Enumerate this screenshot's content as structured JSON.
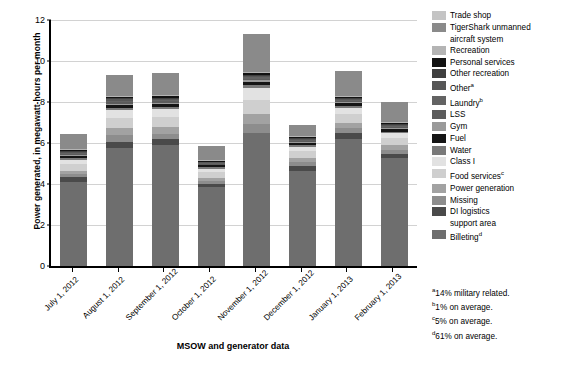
{
  "chart_data": {
    "type": "bar",
    "title": "",
    "xlabel": "MSOW and generator data",
    "ylabel": "Power generated, in megawatt-hours per month",
    "ylim": [
      0,
      12
    ],
    "yticks": [
      0,
      2,
      4,
      6,
      8,
      10,
      12
    ],
    "grid": true,
    "stacked": true,
    "legend_position": "right",
    "categories": [
      "July 1, 2012",
      "August 1, 2012",
      "September 1, 2012",
      "October 1, 2012",
      "November 1, 2012",
      "December 1, 2012",
      "January 1, 2013",
      "February 1, 2013"
    ],
    "totals": [
      6.45,
      9.28,
      9.33,
      5.88,
      11.32,
      7.35,
      9.25,
      7.95
    ],
    "series": [
      {
        "name": "Billeting",
        "color": "#6e6e6e",
        "values": [
          4.1,
          5.75,
          5.9,
          3.85,
          6.5,
          4.65,
          6.2,
          5.25
        ]
      },
      {
        "name": "DI logistics support area",
        "color": "#4a4a4a",
        "values": [
          0.22,
          0.32,
          0.28,
          0.16,
          0.0,
          0.25,
          0.3,
          0.22
        ]
      },
      {
        "name": "Missing",
        "color": "#8d8d8d",
        "values": [
          0.16,
          0.3,
          0.28,
          0.14,
          0.42,
          0.18,
          0.24,
          0.2
        ]
      },
      {
        "name": "Power generation",
        "color": "#a2a2a2",
        "values": [
          0.18,
          0.34,
          0.32,
          0.16,
          0.48,
          0.2,
          0.26,
          0.22
        ]
      },
      {
        "name": "Food services",
        "color": "#cfcfcf",
        "values": [
          0.3,
          0.52,
          0.5,
          0.26,
          0.72,
          0.32,
          0.42,
          0.34
        ]
      },
      {
        "name": "Class I",
        "color": "#e2e2e2",
        "values": [
          0.22,
          0.38,
          0.36,
          0.18,
          0.56,
          0.22,
          0.3,
          0.24
        ]
      },
      {
        "name": "Water",
        "color": "#7a7a7a",
        "values": [
          0.08,
          0.12,
          0.12,
          0.06,
          0.16,
          0.08,
          0.1,
          0.08
        ]
      },
      {
        "name": "Fuel",
        "color": "#151515",
        "values": [
          0.1,
          0.13,
          0.13,
          0.1,
          0.14,
          0.1,
          0.12,
          0.12
        ]
      },
      {
        "name": "Gym",
        "color": "#9a9a9a",
        "values": [
          0.05,
          0.07,
          0.07,
          0.04,
          0.08,
          0.05,
          0.06,
          0.05
        ]
      },
      {
        "name": "LSS",
        "color": "#5c5c5c",
        "values": [
          0.05,
          0.07,
          0.07,
          0.04,
          0.08,
          0.05,
          0.06,
          0.05
        ]
      },
      {
        "name": "Laundry",
        "color": "#636363",
        "values": [
          0.05,
          0.07,
          0.07,
          0.04,
          0.08,
          0.05,
          0.06,
          0.05
        ]
      },
      {
        "name": "Other",
        "color": "#565656",
        "values": [
          0.04,
          0.06,
          0.06,
          0.03,
          0.06,
          0.04,
          0.05,
          0.04
        ]
      },
      {
        "name": "Other recreation",
        "color": "#3f3f3f",
        "values": [
          0.05,
          0.06,
          0.06,
          0.04,
          0.06,
          0.05,
          0.05,
          0.05
        ]
      },
      {
        "name": "Personal services",
        "color": "#121212",
        "values": [
          0.05,
          0.06,
          0.06,
          0.04,
          0.06,
          0.05,
          0.05,
          0.05
        ]
      },
      {
        "name": "Recreation",
        "color": "#b4b4b4",
        "values": [
          0.05,
          0.06,
          0.06,
          0.04,
          0.06,
          0.05,
          0.05,
          0.05
        ]
      },
      {
        "name": "TigerShark unmanned aircraft system",
        "color": "#8a8a8a",
        "values": [
          0.75,
          1.03,
          1.09,
          0.7,
          1.86,
          0.56,
          1.18,
          0.99
        ]
      },
      {
        "name": "Trade shop",
        "color": "#c4c4c4",
        "values": [
          0.0,
          0.0,
          0.0,
          0.0,
          0.0,
          0.0,
          0.0,
          0.0
        ]
      }
    ]
  },
  "legend": {
    "items": [
      {
        "label": "Trade shop",
        "color": "#c4c4c4",
        "note": ""
      },
      {
        "label": "TigerShark unmanned",
        "color": "#8a8a8a",
        "note": "",
        "cont": "aircraft system"
      },
      {
        "label": "Recreation",
        "color": "#b4b4b4",
        "note": ""
      },
      {
        "label": "Personal services",
        "color": "#121212",
        "note": ""
      },
      {
        "label": "Other recreation",
        "color": "#3f3f3f",
        "note": ""
      },
      {
        "label": "Other",
        "color": "#565656",
        "note": "a"
      },
      {
        "label": "Laundry",
        "color": "#636363",
        "note": "b"
      },
      {
        "label": "LSS",
        "color": "#5c5c5c",
        "note": ""
      },
      {
        "label": "Gym",
        "color": "#9a9a9a",
        "note": ""
      },
      {
        "label": "Fuel",
        "color": "#151515",
        "note": ""
      },
      {
        "label": "Water",
        "color": "#7a7a7a",
        "note": ""
      },
      {
        "label": "Class I",
        "color": "#e2e2e2",
        "note": ""
      },
      {
        "label": "Food services",
        "color": "#cfcfcf",
        "note": "c"
      },
      {
        "label": "Power generation",
        "color": "#a2a2a2",
        "note": ""
      },
      {
        "label": "Missing",
        "color": "#8d8d8d",
        "note": ""
      },
      {
        "label": "DI logistics",
        "color": "#4a4a4a",
        "note": "",
        "cont": "support area"
      },
      {
        "label": "Billeting",
        "color": "#6e6e6e",
        "note": "d"
      }
    ]
  },
  "footnotes": [
    {
      "marker": "a",
      "text": "14% military related."
    },
    {
      "marker": "b",
      "text": "1% on average."
    },
    {
      "marker": "c",
      "text": "5% on average."
    },
    {
      "marker": "d",
      "text": "61% on average."
    }
  ]
}
